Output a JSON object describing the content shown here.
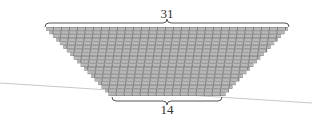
{
  "diagram": {
    "type": "brick-trapezoid",
    "top_label": "31",
    "bottom_label": "14",
    "rows": 19,
    "colors": {
      "brick": "#b9b9b9",
      "mortar": "#7d7d7d",
      "brace": "#555555",
      "ground_line": "#c8c8c8",
      "label": "#333333"
    },
    "geometry": {
      "top_y": 27,
      "bottom_y": 96,
      "top_left_x": 46,
      "top_right_x": 288,
      "bottom_left_x": 112,
      "bottom_right_x": 222
    },
    "ground_line": {
      "x1": 0,
      "y1": 83,
      "x2": 312,
      "y2": 103
    }
  }
}
